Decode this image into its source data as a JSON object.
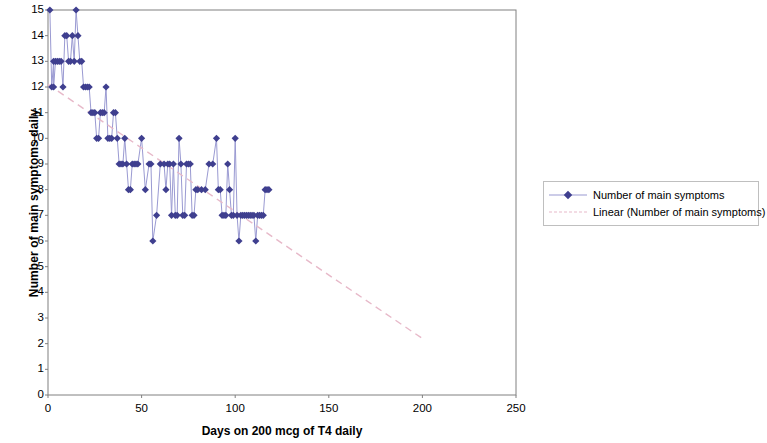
{
  "chart_data": {
    "type": "scatter",
    "title": "",
    "xlabel": "Days on 200 mcg of T4 daily",
    "ylabel": "Number of main symptoms daily",
    "xlim": [
      0,
      250
    ],
    "ylim": [
      0,
      15
    ],
    "xticks": [
      0,
      50,
      100,
      150,
      200,
      250
    ],
    "yticks": [
      0,
      1,
      2,
      3,
      4,
      5,
      6,
      7,
      8,
      9,
      10,
      11,
      12,
      13,
      14,
      15
    ],
    "grid": false,
    "legend_position": "right",
    "marker_color": "#3f3f8f",
    "line_color": "#9a9ad2",
    "trendline_color": "#e7b9c9",
    "legend": [
      {
        "label": "Number of main symptoms",
        "key": "marker-line"
      },
      {
        "label": "Linear (Number of main symptoms)",
        "key": "dashed-line"
      }
    ],
    "series": [
      {
        "name": "Number of main symptoms",
        "x": [
          1,
          2,
          3,
          3,
          4,
          5,
          6,
          7,
          8,
          9,
          10,
          11,
          12,
          13,
          14,
          15,
          16,
          17,
          18,
          19,
          20,
          21,
          22,
          23,
          24,
          25,
          26,
          27,
          28,
          29,
          30,
          31,
          32,
          33,
          34,
          35,
          36,
          37,
          38,
          39,
          40,
          41,
          42,
          43,
          44,
          45,
          46,
          47,
          48,
          50,
          52,
          54,
          55,
          56,
          58,
          60,
          62,
          63,
          64,
          65,
          66,
          67,
          68,
          69,
          70,
          71,
          72,
          73,
          74,
          75,
          76,
          77,
          78,
          79,
          80,
          82,
          84,
          86,
          88,
          90,
          91,
          92,
          93,
          94,
          95,
          96,
          97,
          98,
          99,
          100,
          101,
          102,
          103,
          104,
          105,
          106,
          107,
          108,
          109,
          110,
          111,
          112,
          113,
          114,
          115,
          116,
          117,
          118
        ],
        "y": [
          15,
          12,
          13,
          12,
          13,
          13,
          13,
          13,
          12,
          14,
          14,
          13,
          13,
          14,
          13,
          15,
          14,
          13,
          13,
          12,
          12,
          12,
          12,
          11,
          11,
          11,
          10,
          10,
          11,
          11,
          11,
          12,
          10,
          10,
          10,
          11,
          11,
          10,
          9,
          9,
          9,
          10,
          9,
          8,
          8,
          9,
          9,
          9,
          9,
          10,
          8,
          9,
          9,
          6,
          7,
          9,
          9,
          8,
          9,
          9,
          7,
          9,
          7,
          7,
          10,
          9,
          7,
          7,
          9,
          9,
          9,
          7,
          7,
          8,
          8,
          8,
          8,
          9,
          9,
          10,
          8,
          8,
          7,
          7,
          7,
          9,
          8,
          7,
          7,
          10,
          7,
          6,
          7,
          7,
          7,
          7,
          7,
          7,
          7,
          7,
          6,
          7,
          7,
          7,
          7,
          8,
          8,
          8
        ]
      }
    ],
    "trendline": {
      "name": "Linear (Number of main symptoms)",
      "x": [
        0,
        200
      ],
      "y": [
        12.1,
        2.2
      ]
    }
  },
  "axis": {
    "y_label": "Number of main symptoms daily",
    "x_label": "Days on 200 mcg of T4 daily"
  }
}
